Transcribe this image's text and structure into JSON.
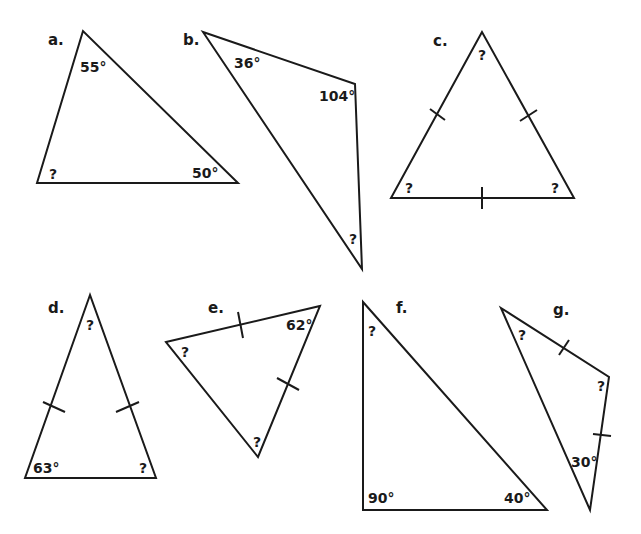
{
  "colors": {
    "stroke": "#1a1a1a",
    "background": "#ffffff"
  },
  "triangles": [
    {
      "id": "a",
      "label": "a.",
      "label_pos": [
        48,
        45
      ],
      "points": [
        [
          83,
          31
        ],
        [
          37,
          183
        ],
        [
          238,
          183
        ]
      ],
      "angles": [
        {
          "text": "55°",
          "pos": [
            80,
            72
          ]
        },
        {
          "text": "?",
          "pos": [
            49,
            179
          ]
        },
        {
          "text": "50°",
          "pos": [
            192,
            178
          ]
        }
      ],
      "ticks": []
    },
    {
      "id": "b",
      "label": "b.",
      "label_pos": [
        183,
        45
      ],
      "points": [
        [
          203,
          32
        ],
        [
          355,
          84
        ],
        [
          362,
          269
        ]
      ],
      "angles": [
        {
          "text": "36°",
          "pos": [
            234,
            68
          ]
        },
        {
          "text": "104°",
          "pos": [
            319,
            101
          ]
        },
        {
          "text": "?",
          "pos": [
            349,
            244
          ]
        }
      ],
      "ticks": []
    },
    {
      "id": "c",
      "label": "c.",
      "label_pos": [
        433,
        46
      ],
      "points": [
        [
          482,
          32
        ],
        [
          391,
          198
        ],
        [
          574,
          198
        ]
      ],
      "angles": [
        {
          "text": "?",
          "pos": [
            478,
            60
          ]
        },
        {
          "text": "?",
          "pos": [
            405,
            193
          ]
        },
        {
          "text": "?",
          "pos": [
            551,
            193
          ]
        }
      ],
      "ticks": [
        [
          [
            430,
            109
          ],
          [
            445,
            120
          ]
        ],
        [
          [
            520,
            121
          ],
          [
            537,
            110
          ]
        ],
        [
          [
            482,
            187
          ],
          [
            482,
            209
          ]
        ]
      ]
    },
    {
      "id": "d",
      "label": "d.",
      "label_pos": [
        48,
        313
      ],
      "points": [
        [
          90,
          295
        ],
        [
          25,
          478
        ],
        [
          156,
          478
        ]
      ],
      "angles": [
        {
          "text": "?",
          "pos": [
            86,
            330
          ]
        },
        {
          "text": "63°",
          "pos": [
            33,
            473
          ]
        },
        {
          "text": "?",
          "pos": [
            139,
            473
          ]
        }
      ],
      "ticks": [
        [
          [
            43,
            402
          ],
          [
            65,
            412
          ]
        ],
        [
          [
            116,
            412
          ],
          [
            139,
            402
          ]
        ]
      ]
    },
    {
      "id": "e",
      "label": "e.",
      "label_pos": [
        208,
        313
      ],
      "points": [
        [
          166,
          342
        ],
        [
          320,
          306
        ],
        [
          258,
          457
        ]
      ],
      "angles": [
        {
          "text": "62°",
          "pos": [
            286,
            330
          ]
        },
        {
          "text": "?",
          "pos": [
            181,
            357
          ]
        },
        {
          "text": "?",
          "pos": [
            253,
            447
          ]
        }
      ],
      "ticks": [
        [
          [
            238,
            312
          ],
          [
            243,
            338
          ]
        ],
        [
          [
            277,
            378
          ],
          [
            299,
            390
          ]
        ]
      ]
    },
    {
      "id": "f",
      "label": "f.",
      "label_pos": [
        396,
        313
      ],
      "points": [
        [
          363,
          302
        ],
        [
          363,
          510
        ],
        [
          547,
          510
        ]
      ],
      "angles": [
        {
          "text": "?",
          "pos": [
            368,
            336
          ]
        },
        {
          "text": "90°",
          "pos": [
            368,
            503
          ]
        },
        {
          "text": "40°",
          "pos": [
            504,
            503
          ]
        }
      ],
      "ticks": []
    },
    {
      "id": "g",
      "label": "g.",
      "label_pos": [
        553,
        315
      ],
      "points": [
        [
          501,
          308
        ],
        [
          609,
          377
        ],
        [
          590,
          510
        ]
      ],
      "angles": [
        {
          "text": "?",
          "pos": [
            518,
            340
          ]
        },
        {
          "text": "?",
          "pos": [
            597,
            391
          ]
        },
        {
          "text": "30°",
          "pos": [
            571,
            467
          ]
        }
      ],
      "ticks": [
        [
          [
            559,
            355
          ],
          [
            569,
            340
          ]
        ],
        [
          [
            593,
            434
          ],
          [
            611,
            436
          ]
        ]
      ]
    }
  ]
}
